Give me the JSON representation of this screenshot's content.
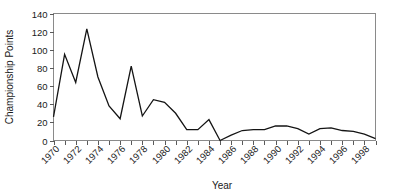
{
  "chart_data": {
    "type": "line",
    "title": "",
    "xlabel": "Year",
    "ylabel": "Championship Points",
    "xlim": [
      1970,
      1999
    ],
    "ylim": [
      0,
      140
    ],
    "ytick_labels": [
      "0",
      "20",
      "40",
      "60",
      "80",
      "100",
      "120",
      "140"
    ],
    "ytick_values": [
      0,
      20,
      40,
      60,
      80,
      100,
      120,
      140
    ],
    "xtick_values": [
      1970,
      1971,
      1972,
      1973,
      1974,
      1975,
      1976,
      1977,
      1978,
      1979,
      1980,
      1981,
      1982,
      1983,
      1984,
      1985,
      1986,
      1987,
      1988,
      1989,
      1990,
      1991,
      1992,
      1993,
      1994,
      1995,
      1996,
      1997,
      1998,
      1999
    ],
    "xtick_labels_shown": [
      "1970",
      "1972",
      "1974",
      "1976",
      "1978",
      "1980",
      "1982",
      "1984",
      "1986",
      "1988",
      "1990",
      "1992",
      "1994",
      "1996",
      "1998"
    ],
    "grid": false,
    "legend": false,
    "line_color": "#141414",
    "x": [
      1970,
      1971,
      1972,
      1973,
      1974,
      1975,
      1976,
      1977,
      1978,
      1979,
      1980,
      1981,
      1982,
      1983,
      1984,
      1985,
      1986,
      1987,
      1988,
      1989,
      1990,
      1991,
      1992,
      1993,
      1994,
      1995,
      1996,
      1997,
      1998,
      1999
    ],
    "values": [
      26,
      95,
      64,
      123,
      70,
      38,
      24,
      82,
      27,
      45,
      42,
      30,
      12,
      12,
      23,
      0,
      6,
      11,
      12,
      12,
      16,
      16,
      13,
      7,
      13,
      14,
      11,
      10,
      7,
      2
    ],
    "series": [
      {
        "name": "Championship Points",
        "values": [
          26,
          95,
          64,
          123,
          70,
          38,
          24,
          82,
          27,
          45,
          42,
          30,
          12,
          12,
          23,
          0,
          6,
          11,
          12,
          12,
          16,
          16,
          13,
          7,
          13,
          14,
          11,
          10,
          7,
          2
        ]
      }
    ]
  }
}
